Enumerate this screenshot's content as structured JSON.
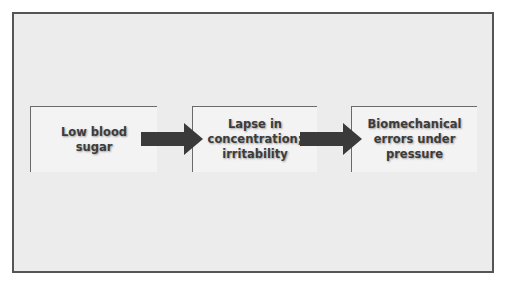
{
  "diagram": {
    "nodes": [
      {
        "id": "n1",
        "label": "Low blood\nsugar"
      },
      {
        "id": "n2",
        "label": "Lapse in\nconcentration;\nirritability"
      },
      {
        "id": "n3",
        "label": "Biomechanical\nerrors under\npressure"
      }
    ],
    "edges": [
      {
        "from": "n1",
        "to": "n2"
      },
      {
        "from": "n2",
        "to": "n3"
      }
    ],
    "colors": {
      "frame_bg": "#ececec",
      "frame_border": "#555555",
      "box_bg": "#f3f3f3",
      "arrow": "#3a3a3a",
      "text": "#3c3c3c"
    }
  }
}
